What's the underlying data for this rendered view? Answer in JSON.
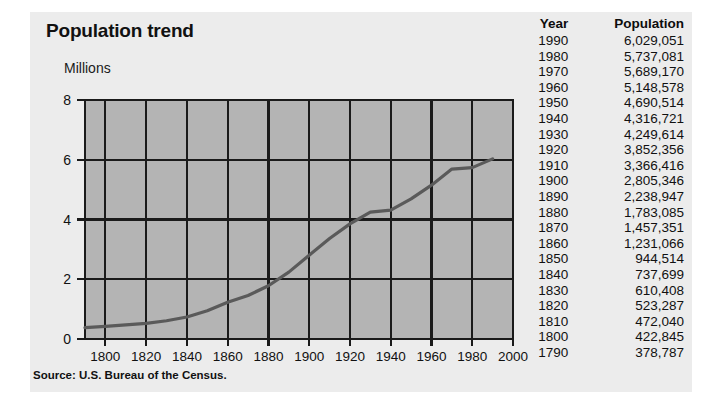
{
  "figure": {
    "title": "Population trend",
    "source": "Source: U.S. Bureau of the Census.",
    "panel_color": "#ececec",
    "plot_fill": "#b4b4b4",
    "grid_color": "#1a1a1a",
    "line_color": "#5a5a5a"
  },
  "table": {
    "headers": {
      "year": "Year",
      "population": "Population"
    },
    "rows": [
      {
        "year": "1990",
        "population": "6,029,051"
      },
      {
        "year": "1980",
        "population": "5,737,081"
      },
      {
        "year": "1970",
        "population": "5,689,170"
      },
      {
        "year": "1960",
        "population": "5,148,578"
      },
      {
        "year": "1950",
        "population": "4,690,514"
      },
      {
        "year": "1940",
        "population": "4,316,721"
      },
      {
        "year": "1930",
        "population": "4,249,614"
      },
      {
        "year": "1920",
        "population": "3,852,356"
      },
      {
        "year": "1910",
        "population": "3,366,416"
      },
      {
        "year": "1900",
        "population": "2,805,346"
      },
      {
        "year": "1890",
        "population": "2,238,947"
      },
      {
        "year": "1880",
        "population": "1,783,085"
      },
      {
        "year": "1870",
        "population": "1,457,351"
      },
      {
        "year": "1860",
        "population": "1,231,066"
      },
      {
        "year": "1850",
        "population": "944,514"
      },
      {
        "year": "1840",
        "population": "737,699"
      },
      {
        "year": "1830",
        "population": "610,408"
      },
      {
        "year": "1820",
        "population": "523,287"
      },
      {
        "year": "1810",
        "population": "472,040"
      },
      {
        "year": "1800",
        "population": "422,845"
      },
      {
        "year": "1790",
        "population": "378,787"
      }
    ]
  },
  "chart_data": {
    "type": "line",
    "title": "Population trend",
    "xlabel": "",
    "ylabel": "Millions",
    "xlim": [
      1790,
      2000
    ],
    "ylim": [
      0,
      8
    ],
    "xticks": [
      1800,
      1820,
      1840,
      1860,
      1880,
      1900,
      1920,
      1940,
      1960,
      1980,
      2000
    ],
    "yticks": [
      0,
      2,
      4,
      6,
      8
    ],
    "grid": true,
    "legend": null,
    "x": [
      1790,
      1800,
      1810,
      1820,
      1830,
      1840,
      1850,
      1860,
      1870,
      1880,
      1890,
      1900,
      1910,
      1920,
      1930,
      1940,
      1950,
      1960,
      1970,
      1980,
      1990
    ],
    "values": [
      0.378787,
      0.422845,
      0.47204,
      0.523287,
      0.610408,
      0.737699,
      0.944514,
      1.231066,
      1.457351,
      1.783085,
      2.238947,
      2.805346,
      3.366416,
      3.852356,
      4.249614,
      4.316721,
      4.690514,
      5.148578,
      5.68917,
      5.737081,
      6.029051
    ],
    "units": "millions"
  }
}
